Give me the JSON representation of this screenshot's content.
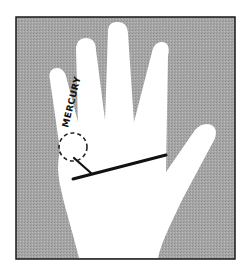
{
  "figure": {
    "colors": {
      "background": "#a9a9a9",
      "hand": "#ffffff",
      "frame": "#1a1a1a",
      "line": "#111111"
    },
    "labels": {
      "finger_label": "MERCURY"
    },
    "annotations": {
      "circle": "dashed circle at base of Mercury (little) finger",
      "main_line": "heavy line across palm",
      "branch_line": "short branch from main line up into dashed circle"
    }
  }
}
